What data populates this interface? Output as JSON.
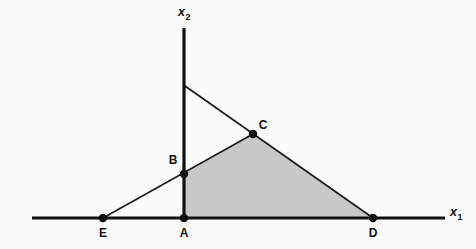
{
  "figure": {
    "background_color": "#fbfbfb",
    "width": 476,
    "height": 249,
    "line_color": "#1a1a1a",
    "axis_color": "#111111",
    "shade_color": "#c8c8c8"
  },
  "axes": {
    "x_axis": {
      "label_main": "x",
      "label_sub": "1",
      "label_x": 450,
      "label_y": 216,
      "sub_x": 460,
      "sub_y": 221,
      "x1": 32,
      "y1": 218,
      "x2": 445,
      "y2": 218
    },
    "y_axis": {
      "label_main": "x",
      "label_sub": "2",
      "label_x": 178,
      "label_y": 16,
      "sub_x": 188,
      "sub_y": 21,
      "x1": 184,
      "y1": 28,
      "x2": 184,
      "y2": 218
    }
  },
  "points": [
    {
      "id": "A",
      "label": "A",
      "x": 184,
      "y": 218,
      "label_x": 184,
      "label_y": 234,
      "anchor": "middle"
    },
    {
      "id": "B",
      "label": "B",
      "x": 184,
      "y": 174,
      "label_x": 173,
      "label_y": 161,
      "anchor": "middle"
    },
    {
      "id": "C",
      "label": "C",
      "x": 253,
      "y": 134,
      "label_x": 263,
      "label_y": 126,
      "anchor": "middle"
    },
    {
      "id": "D",
      "label": "D",
      "x": 373,
      "y": 218,
      "label_x": 373,
      "label_y": 234,
      "anchor": "middle"
    },
    {
      "id": "E",
      "label": "E",
      "x": 103,
      "y": 218,
      "label_x": 103,
      "label_y": 234,
      "anchor": "middle"
    }
  ],
  "marker_radius": 4.2,
  "lines": [
    {
      "id": "ascending-ray",
      "name": "line-E-B-C",
      "from_x": 103,
      "from_y": 218,
      "to_x": 253,
      "to_y": 134
    },
    {
      "id": "descending-ray",
      "name": "line-yaxis-C-D",
      "from_x": 185,
      "from_y": 86,
      "to_x": 373,
      "to_y": 218
    }
  ],
  "shaded_region": {
    "name": "feasible-region-ABCD",
    "vertices": "184,218 184,174 253,134 373,218",
    "vertex_ids": [
      "A",
      "B",
      "C",
      "D"
    ],
    "fill": "#c8c8c8"
  },
  "chart_data": {
    "type": "scatter",
    "title": "",
    "xlabel": "x1",
    "ylabel": "x2",
    "grid": false,
    "legend": "none",
    "points": [
      {
        "label": "A",
        "px": 184,
        "py": 218,
        "on": "origin"
      },
      {
        "label": "B",
        "px": 184,
        "py": 174,
        "on": "x2-axis"
      },
      {
        "label": "C",
        "px": 253,
        "py": 134,
        "on": "intersection-of-lines"
      },
      {
        "label": "D",
        "px": 373,
        "py": 218,
        "on": "x1-axis"
      },
      {
        "label": "E",
        "px": 103,
        "py": 218,
        "on": "x1-axis-negative"
      }
    ],
    "series": [
      {
        "name": "ascending line through E, B, C",
        "p1": [
          103,
          218
        ],
        "p2": [
          253,
          134
        ]
      },
      {
        "name": "descending line through C, D",
        "p1": [
          185,
          86
        ],
        "p2": [
          373,
          218
        ]
      }
    ],
    "shaded_polygon": [
      "A",
      "B",
      "C",
      "D"
    ]
  }
}
